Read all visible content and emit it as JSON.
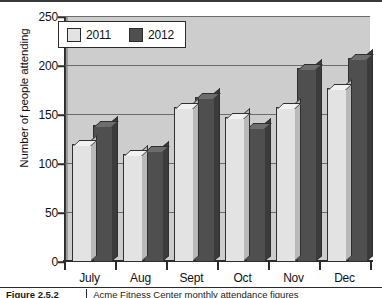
{
  "chart_data": {
    "type": "bar",
    "title": "",
    "xlabel": "",
    "ylabel": "Number of people attending",
    "categories": [
      "July",
      "Aug",
      "Sept",
      "Oct",
      "Nov",
      "Dec"
    ],
    "series": [
      {
        "name": "2011",
        "values": [
          120,
          110,
          158,
          148,
          158,
          178
        ],
        "color": "#e3e3e3"
      },
      {
        "name": "2012",
        "values": [
          140,
          114,
          168,
          138,
          198,
          208
        ],
        "color": "#4f4f4f"
      }
    ],
    "ylim": [
      0,
      250
    ],
    "yticks": [
      0,
      50,
      100,
      150,
      200,
      250
    ],
    "ytick_labels": [
      "0",
      "50",
      "100",
      "150",
      "200",
      "250"
    ],
    "grid": true,
    "grid_axis": "y",
    "legend_position": "top-left",
    "style": "3d-bar",
    "plot_background": "#cdcdcd"
  },
  "legend": {
    "entries": [
      {
        "label": "2011"
      },
      {
        "label": "2012"
      }
    ]
  },
  "caption": {
    "label": "Figure 2.5.2",
    "text": "Acme Fitness Center monthly attendance figures"
  }
}
